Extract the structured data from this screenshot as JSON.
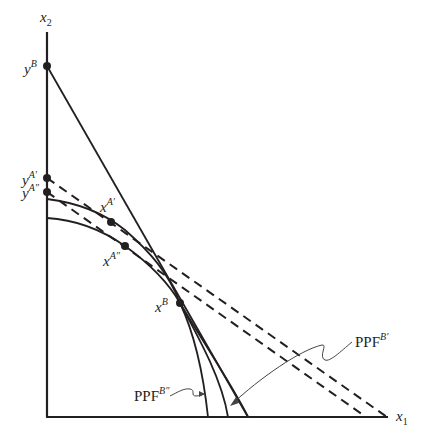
{
  "diagram": {
    "type": "production-possibility-frontier",
    "colors": {
      "ink": "#231f20",
      "leader": "#444444",
      "background": "#ffffff"
    },
    "axes": {
      "x_label": {
        "base": "x",
        "sub": "1"
      },
      "y_label": {
        "base": "x",
        "sub": "2"
      }
    },
    "intercept_labels": {
      "yB": {
        "base": "y",
        "sup": "B"
      },
      "yA1": {
        "base": "y",
        "sup": "A′"
      },
      "yA2": {
        "base": "y",
        "sup": "A″"
      }
    },
    "point_labels": {
      "xA1": {
        "base": "x",
        "sup": "A′"
      },
      "xA2": {
        "base": "x",
        "sup": "A″"
      },
      "xB": {
        "base": "x",
        "sup": "B"
      }
    },
    "curve_labels": {
      "ppfB1": {
        "base": "PPF",
        "sup": "B′"
      },
      "ppfB2": {
        "base": "PPF",
        "sup": "B″"
      }
    },
    "elements": [
      "two concave production possibility frontiers (upper PPF^B′ through x^A′, lower PPF^B″ through x^A″)",
      "solid budget line from y^B tangent at x^B",
      "two parallel dashed budget lines from y^A′ and y^A″ tangent at x^A′ and x^A″"
    ]
  }
}
